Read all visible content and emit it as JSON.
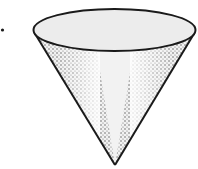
{
  "figure": {
    "colors": {
      "background": "#ffffff",
      "outline": "#1a1a1a",
      "top_fill": "#ececec",
      "body_fill": "#f2f2f2",
      "stipple": "#3a3a3a"
    }
  }
}
